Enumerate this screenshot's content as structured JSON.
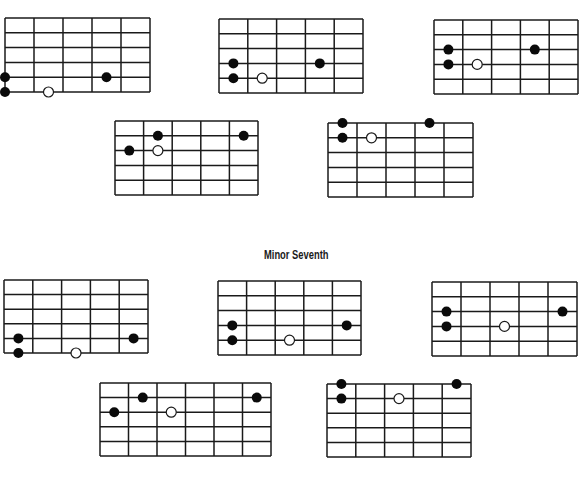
{
  "sections": [
    {
      "title": "Minor Seventh",
      "title_pos": {
        "x": 264,
        "y": 248
      }
    }
  ],
  "style": {
    "line_color": "#1a1a1a",
    "dot_fill": "#0a0a0a",
    "open_dot_fill": "#ffffff",
    "dot_radius": 5,
    "line_width": 1.5
  },
  "diagrams": [
    {
      "id": 1,
      "x": 5,
      "y": 18,
      "w": 145,
      "h": 74,
      "cols": 5,
      "rows": 5,
      "dots": [
        {
          "col": 0,
          "row": 4,
          "type": "filled"
        },
        {
          "col": 0,
          "row": 5,
          "type": "filled"
        },
        {
          "col": 3.5,
          "row": 4,
          "type": "filled"
        },
        {
          "col": 1.5,
          "row": 5,
          "type": "open"
        }
      ]
    },
    {
      "id": 2,
      "x": 219,
      "y": 19,
      "w": 144,
      "h": 74,
      "cols": 5,
      "rows": 5,
      "dots": [
        {
          "col": 0.5,
          "row": 3,
          "type": "filled"
        },
        {
          "col": 0.5,
          "row": 4,
          "type": "filled"
        },
        {
          "col": 3.5,
          "row": 3,
          "type": "filled"
        },
        {
          "col": 1.5,
          "row": 4,
          "type": "open"
        }
      ]
    },
    {
      "id": 3,
      "x": 434,
      "y": 20,
      "w": 144,
      "h": 74,
      "cols": 5,
      "rows": 5,
      "dots": [
        {
          "col": 0.5,
          "row": 2,
          "type": "filled"
        },
        {
          "col": 0.5,
          "row": 3,
          "type": "filled"
        },
        {
          "col": 3.5,
          "row": 2,
          "type": "filled"
        },
        {
          "col": 1.5,
          "row": 3,
          "type": "open"
        }
      ]
    },
    {
      "id": 4,
      "x": 115,
      "y": 121,
      "w": 143,
      "h": 74,
      "cols": 5,
      "rows": 5,
      "dots": [
        {
          "col": 1.5,
          "row": 1,
          "type": "filled"
        },
        {
          "col": 0.5,
          "row": 2,
          "type": "filled"
        },
        {
          "col": 4.5,
          "row": 1,
          "type": "filled"
        },
        {
          "col": 1.5,
          "row": 2,
          "type": "open"
        }
      ]
    },
    {
      "id": 5,
      "x": 328,
      "y": 123,
      "w": 145,
      "h": 74,
      "cols": 5,
      "rows": 5,
      "dots": [
        {
          "col": 0.5,
          "row": 0,
          "type": "filled"
        },
        {
          "col": 0.5,
          "row": 1,
          "type": "filled"
        },
        {
          "col": 3.5,
          "row": 0,
          "type": "filled"
        },
        {
          "col": 1.5,
          "row": 1,
          "type": "open"
        }
      ]
    },
    {
      "id": 6,
      "x": 4,
      "y": 280,
      "w": 144,
      "h": 73,
      "cols": 5,
      "rows": 5,
      "dots": [
        {
          "col": 0.5,
          "row": 4,
          "type": "filled"
        },
        {
          "col": 0.5,
          "row": 5,
          "type": "filled"
        },
        {
          "col": 4.5,
          "row": 4,
          "type": "filled"
        },
        {
          "col": 2.5,
          "row": 5,
          "type": "open"
        }
      ]
    },
    {
      "id": 7,
      "x": 218,
      "y": 281,
      "w": 143,
      "h": 74,
      "cols": 5,
      "rows": 5,
      "dots": [
        {
          "col": 0.5,
          "row": 3,
          "type": "filled"
        },
        {
          "col": 0.5,
          "row": 4,
          "type": "filled"
        },
        {
          "col": 4.5,
          "row": 3,
          "type": "filled"
        },
        {
          "col": 2.5,
          "row": 4,
          "type": "open"
        }
      ]
    },
    {
      "id": 8,
      "x": 432,
      "y": 282,
      "w": 145,
      "h": 74,
      "cols": 5,
      "rows": 5,
      "dots": [
        {
          "col": 0.5,
          "row": 2,
          "type": "filled"
        },
        {
          "col": 0.5,
          "row": 3,
          "type": "filled"
        },
        {
          "col": 4.5,
          "row": 2,
          "type": "filled"
        },
        {
          "col": 2.5,
          "row": 3,
          "type": "open"
        }
      ]
    },
    {
      "id": 9,
      "x": 100,
      "y": 383,
      "w": 171,
      "h": 73,
      "cols": 6,
      "rows": 5,
      "dots": [
        {
          "col": 1.5,
          "row": 1,
          "type": "filled"
        },
        {
          "col": 0.5,
          "row": 2,
          "type": "filled"
        },
        {
          "col": 5.5,
          "row": 1,
          "type": "filled"
        },
        {
          "col": 2.5,
          "row": 2,
          "type": "open"
        }
      ]
    },
    {
      "id": 10,
      "x": 327,
      "y": 384,
      "w": 144,
      "h": 73,
      "cols": 5,
      "rows": 5,
      "dots": [
        {
          "col": 0.5,
          "row": 0,
          "type": "filled"
        },
        {
          "col": 0.5,
          "row": 1,
          "type": "filled"
        },
        {
          "col": 4.5,
          "row": 0,
          "type": "filled"
        },
        {
          "col": 2.5,
          "row": 1,
          "type": "open"
        }
      ]
    }
  ]
}
